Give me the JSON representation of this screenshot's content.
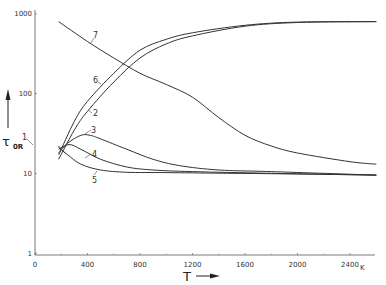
{
  "chart_data": {
    "type": "line",
    "title": "",
    "xlabel": "T",
    "x_unit": "K",
    "ylabel": "τ_0R",
    "yscale": "log",
    "xlim": [
      0,
      2600
    ],
    "ylim": [
      1,
      1000
    ],
    "grid": false,
    "legend": "inline numeric labels 1–7",
    "x_ticks": [
      "0",
      "400",
      "800",
      "1200",
      "1600",
      "2000",
      "2400"
    ],
    "y_ticks": [
      "1",
      "10",
      "100",
      "1000"
    ],
    "series": [
      {
        "name": "1",
        "x": [
          180,
          200,
          230
        ],
        "y": [
          22,
          20,
          18
        ]
      },
      {
        "name": "2",
        "x": [
          180,
          300,
          400,
          600,
          800,
          1000,
          1200,
          1600,
          2000,
          2600
        ],
        "y": [
          15,
          35,
          60,
          140,
          280,
          420,
          530,
          700,
          780,
          800
        ]
      },
      {
        "name": "3",
        "x": [
          180,
          250,
          350,
          420,
          500,
          700,
          900,
          1100,
          1400,
          1800,
          2600
        ],
        "y": [
          18,
          24,
          30,
          30,
          27,
          20,
          15,
          12.5,
          11,
          10.5,
          9.5
        ]
      },
      {
        "name": "4",
        "x": [
          180,
          260,
          350,
          500,
          700,
          900,
          1200,
          1800,
          2600
        ],
        "y": [
          20,
          23,
          20,
          15,
          12,
          11,
          10.5,
          10,
          9.5
        ]
      },
      {
        "name": "5",
        "x": [
          180,
          250,
          350,
          500,
          700,
          1000,
          1500,
          2000,
          2600
        ],
        "y": [
          21,
          17,
          13,
          11,
          10.3,
          10.2,
          10,
          9.8,
          9.5
        ]
      },
      {
        "name": "6",
        "x": [
          180,
          300,
          400,
          600,
          800,
          1000,
          1200,
          1600,
          2000,
          2600
        ],
        "y": [
          17,
          45,
          80,
          180,
          350,
          480,
          580,
          720,
          790,
          800
        ]
      },
      {
        "name": "7",
        "x": [
          180,
          400,
          600,
          800,
          1000,
          1200,
          1400,
          1600,
          1800,
          2000,
          2400,
          2600
        ],
        "y": [
          800,
          450,
          280,
          180,
          130,
          90,
          50,
          30,
          22,
          18,
          14,
          13
        ]
      }
    ]
  },
  "axes": {
    "x_label": "T",
    "x_unit": "K",
    "y_label": "τ",
    "y_sub": "0R"
  }
}
